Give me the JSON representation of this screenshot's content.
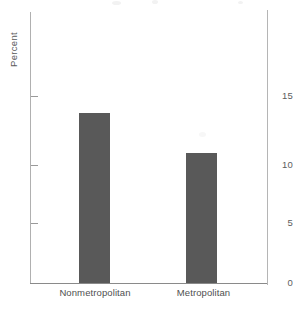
{
  "chart_data": {
    "type": "bar",
    "title": "",
    "subtitle": "",
    "xlabel": "",
    "ylabel": "Percent",
    "categories": [
      "Nonmetropolitan",
      "Metropolitan"
    ],
    "values": [
      13.6,
      10.4
    ],
    "ylim": [
      0,
      17.5
    ],
    "yticks": [
      "0",
      "5",
      "10",
      "15"
    ],
    "ytick_values": [
      0,
      5,
      10,
      15
    ],
    "grid": false,
    "legend": null,
    "bar_color": "#595959",
    "axis_color": "#9a9a9a",
    "background": "#ffffff"
  },
  "figure": {
    "width": 293,
    "height": 309
  }
}
